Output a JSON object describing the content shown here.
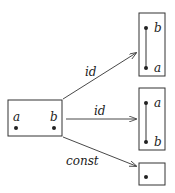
{
  "diagram": {
    "source": {
      "labels": [
        "a",
        "b"
      ]
    },
    "targets": [
      {
        "top_label": "b",
        "bottom_label": "a"
      },
      {
        "top_label": "a",
        "bottom_label": "b"
      },
      {
        "points": 1
      }
    ],
    "arrows": [
      {
        "label": "id"
      },
      {
        "label": "id"
      },
      {
        "label": "const"
      }
    ],
    "colors": {
      "stroke": "#333333",
      "dot": "#222222"
    }
  }
}
